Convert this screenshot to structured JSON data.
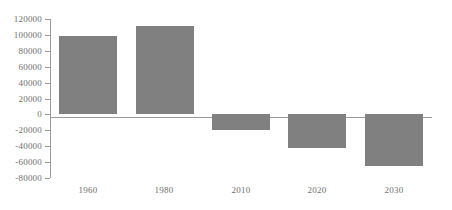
{
  "chart_data": {
    "type": "bar",
    "title": "",
    "xlabel": "",
    "ylabel": "",
    "categories": [
      "1960",
      "1980",
      "2010",
      "2020",
      "2030"
    ],
    "values": [
      98000,
      111000,
      -20000,
      -43000,
      -66000
    ],
    "ylim": [
      -80000,
      120000
    ],
    "ytick_labels": [
      "120000",
      "100000",
      "80000",
      "60000",
      "40000",
      "20000",
      "0",
      "-20000",
      "-40000",
      "-60000",
      "-80000"
    ],
    "ytick_values": [
      120000,
      100000,
      80000,
      60000,
      40000,
      20000,
      0,
      -20000,
      -40000,
      -60000,
      -80000
    ],
    "grid": false,
    "legend": null,
    "legend_position": "none",
    "bar_color": "#808080",
    "axis_color": "#9a9a9a",
    "tick_label_color": "#6f6f6f",
    "background_color": "#ffffff"
  }
}
